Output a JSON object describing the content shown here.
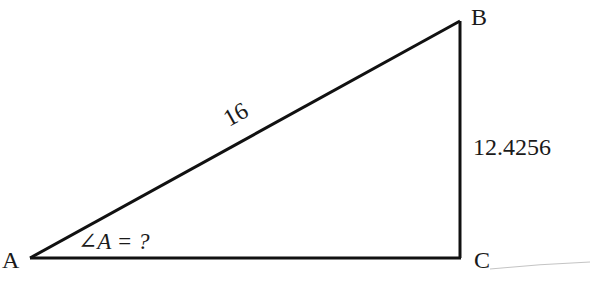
{
  "diagram": {
    "type": "right-triangle",
    "vertices": {
      "A": {
        "label": "A"
      },
      "B": {
        "label": "B"
      },
      "C": {
        "label": "C"
      }
    },
    "sides": {
      "hypotenuse_AB": {
        "label": "16"
      },
      "opposite_BC": {
        "label": "12.4256"
      }
    },
    "angle_annotation": {
      "label": "∠A = ?"
    },
    "colors": {
      "stroke": "#111111",
      "text": "#1a1a1a",
      "artifact": "#bdbdbd"
    }
  }
}
